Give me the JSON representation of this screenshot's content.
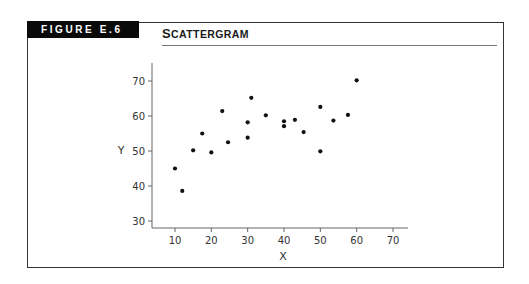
{
  "figure": {
    "label": "FIGURE E.6",
    "title_first": "S",
    "title_rest": "CATTERGRAM"
  },
  "chart_data": {
    "type": "scatter",
    "title": "Scattergram",
    "xlabel": "X",
    "ylabel": "Y",
    "xlim": [
      4,
      74
    ],
    "ylim": [
      27,
      75
    ],
    "xticks": [
      10,
      20,
      30,
      40,
      50,
      60,
      70
    ],
    "yticks": [
      30,
      40,
      50,
      60,
      70
    ],
    "grid": false,
    "legend": null,
    "series": [
      {
        "name": "points",
        "color": "#111111",
        "points": [
          {
            "x": 10,
            "y": 45
          },
          {
            "x": 12,
            "y": 38.6
          },
          {
            "x": 15,
            "y": 50.2
          },
          {
            "x": 17.5,
            "y": 55
          },
          {
            "x": 20,
            "y": 49.6
          },
          {
            "x": 23,
            "y": 61.4
          },
          {
            "x": 24.6,
            "y": 52.5
          },
          {
            "x": 30,
            "y": 58.2
          },
          {
            "x": 30,
            "y": 53.8
          },
          {
            "x": 31,
            "y": 65.2
          },
          {
            "x": 35,
            "y": 60.2
          },
          {
            "x": 40,
            "y": 58.5
          },
          {
            "x": 40,
            "y": 57.1
          },
          {
            "x": 43,
            "y": 58.9
          },
          {
            "x": 45.4,
            "y": 55.4
          },
          {
            "x": 50,
            "y": 62.6
          },
          {
            "x": 50,
            "y": 49.9
          },
          {
            "x": 53.6,
            "y": 58.7
          },
          {
            "x": 57.6,
            "y": 60.3
          },
          {
            "x": 60,
            "y": 70.2
          }
        ]
      }
    ]
  }
}
